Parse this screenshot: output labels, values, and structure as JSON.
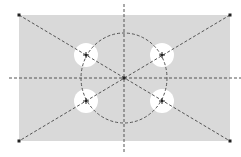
{
  "diagram": {
    "title": "",
    "colors": {
      "background": "#ffffff",
      "plate_fill": "#d9d9d9",
      "hole_fill": "#ffffff",
      "line": "#555555",
      "point": "#222222"
    },
    "plate": {
      "x": 19,
      "y": 15,
      "width": 211,
      "height": 126
    },
    "center": {
      "x": 124,
      "y": 78
    },
    "bolt_circle": {
      "cx": 124,
      "cy": 78,
      "rx": 43,
      "ry": 45
    },
    "holes": [
      {
        "id": "top-left",
        "cx": 86,
        "cy": 55,
        "r": 12
      },
      {
        "id": "top-right",
        "cx": 162,
        "cy": 55,
        "r": 12
      },
      {
        "id": "bottom-left",
        "cx": 86,
        "cy": 101,
        "r": 12
      },
      {
        "id": "bottom-right",
        "cx": 162,
        "cy": 101,
        "r": 12
      }
    ],
    "axes": {
      "horizontal": {
        "x1": 9,
        "y1": 78,
        "x2": 241,
        "y2": 78
      },
      "vertical": {
        "x1": 124,
        "y1": 4,
        "x2": 124,
        "y2": 153
      }
    },
    "diagonals": [
      {
        "x1": 19,
        "y1": 15,
        "x2": 230,
        "y2": 141
      },
      {
        "x1": 230,
        "y1": 15,
        "x2": 19,
        "y2": 141
      }
    ],
    "corners": [
      {
        "x": 19,
        "y": 15
      },
      {
        "x": 230,
        "y": 15
      },
      {
        "x": 19,
        "y": 141
      },
      {
        "x": 230,
        "y": 141
      }
    ]
  }
}
